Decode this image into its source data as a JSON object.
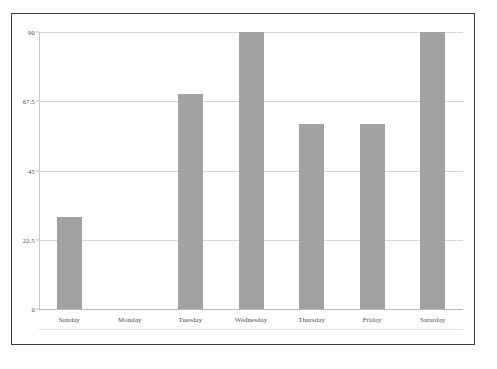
{
  "chart_data": {
    "type": "bar",
    "title": "",
    "xlabel": "",
    "ylabel": "",
    "categories": [
      "Sunday",
      "Monday",
      "Tuesday",
      "Wednesday",
      "Thursday",
      "Friday",
      "Saturday"
    ],
    "values": [
      30,
      0,
      70,
      90,
      60,
      60,
      90
    ],
    "series": [
      {
        "name": "",
        "values": [
          30,
          0,
          70,
          90,
          60,
          60,
          90
        ]
      }
    ],
    "ylim": [
      0,
      90
    ],
    "yticks": [
      0,
      22.5,
      45,
      67.5,
      90
    ],
    "ytick_labels": [
      "0",
      "22.5",
      "45",
      "67.5",
      "90"
    ],
    "grid": true,
    "legend": "none",
    "bar_color": "#a2a2a2",
    "gridline_color": "#d6d6d6",
    "axis_color": "#b9b9b9",
    "frame_color": "#3a3a3a",
    "background_color": "#ffffff",
    "text_color": "#4a4a4a"
  }
}
